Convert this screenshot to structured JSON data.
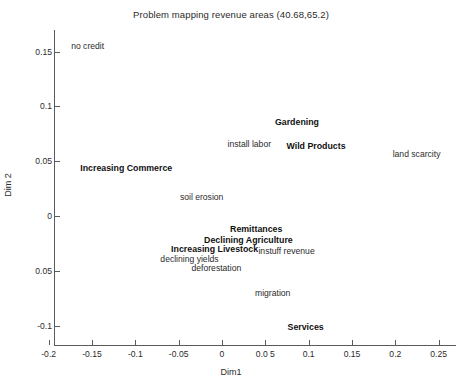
{
  "chart_data": {
    "type": "scatter",
    "title": "Problem mapping revenue areas (40.68,65.2)",
    "xlabel": "Dim1",
    "ylabel": "Dim 2",
    "xlim": [
      -0.215,
      0.28
    ],
    "ylim": [
      -0.12,
      0.175
    ],
    "grid": false,
    "legend": "none",
    "xticks": [
      {
        "value": -0.2,
        "label": "-0.2"
      },
      {
        "value": -0.15,
        "label": "-0.15"
      },
      {
        "value": -0.1,
        "label": "-0.1"
      },
      {
        "value": -0.05,
        "label": "-0.05"
      },
      {
        "value": 0,
        "label": "0"
      },
      {
        "value": 0.05,
        "label": "0.0 5"
      },
      {
        "value": 0.1,
        "label": "0.1"
      },
      {
        "value": 0.15,
        "label": "0.15"
      },
      {
        "value": 0.2,
        "label": "0.2"
      },
      {
        "value": 0.25,
        "label": "0.25"
      }
    ],
    "yticks": [
      {
        "value": 0.15,
        "label": "0.15"
      },
      {
        "value": 0.1,
        "label": "0.1"
      },
      {
        "value": 0.05,
        "label": "0.05"
      },
      {
        "value": 0,
        "label": "0"
      },
      {
        "value": -0.05,
        "label": "0.05"
      },
      {
        "value": -0.1,
        "label": "-0.1"
      }
    ],
    "points": [
      {
        "label": "no credit",
        "x": -0.155,
        "y": 0.1555,
        "bold": false
      },
      {
        "label": "Gardening",
        "x": 0.0865,
        "y": 0.0855,
        "bold": true
      },
      {
        "label": "install labor",
        "x": 0.0315,
        "y": 0.0655,
        "bold": false
      },
      {
        "label": "Wild Products",
        "x": 0.1085,
        "y": 0.0635,
        "bold": true
      },
      {
        "label": "land scarcity",
        "x": 0.2245,
        "y": 0.0565,
        "bold": false
      },
      {
        "label": "Increasing Commerce",
        "x": -0.1105,
        "y": 0.0435,
        "bold": true
      },
      {
        "label": "soil erosion",
        "x": -0.0235,
        "y": 0.0175,
        "bold": false
      },
      {
        "label": "Remittances",
        "x": 0.0395,
        "y": -0.0115,
        "bold": true
      },
      {
        "label": "Declining Agriculture",
        "x": 0.0305,
        "y": -0.0215,
        "bold": true
      },
      {
        "label": "Increasing Livestock",
        "x": -0.0085,
        "y": -0.0305,
        "bold": true
      },
      {
        "label": "instuff revenue",
        "x": 0.0745,
        "y": -0.0315,
        "bold": false
      },
      {
        "label": "declining yields",
        "x": -0.0375,
        "y": -0.0395,
        "bold": false
      },
      {
        "label": "deforestation",
        "x": -0.0065,
        "y": -0.0475,
        "bold": false
      },
      {
        "label": "migration",
        "x": 0.0585,
        "y": -0.0705,
        "bold": false
      },
      {
        "label": "Services",
        "x": 0.0965,
        "y": -0.1015,
        "bold": true
      }
    ]
  }
}
